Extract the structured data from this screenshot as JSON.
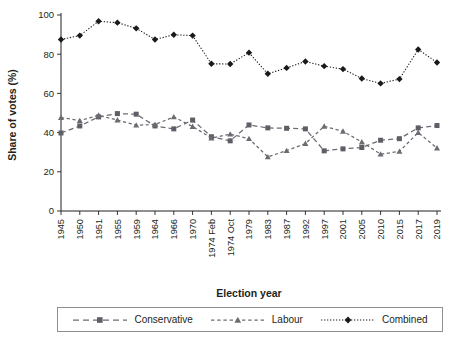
{
  "chart_data": {
    "type": "line",
    "title": "",
    "xlabel": "Election year",
    "ylabel": "Share of votes (%)",
    "ylim": [
      0,
      100
    ],
    "yticks": [
      0,
      20,
      40,
      60,
      80,
      100
    ],
    "grid": false,
    "legend_position": "bottom",
    "categories": [
      "1945",
      "1950",
      "1951",
      "1955",
      "1959",
      "1964",
      "1966",
      "1970",
      "1974 Feb",
      "1974 Oct",
      "1979",
      "1983",
      "1987",
      "1992",
      "1997",
      "2001",
      "2005",
      "2010",
      "2015",
      "2017",
      "2019"
    ],
    "series": [
      {
        "name": "Conservative",
        "marker": "square",
        "linestyle": "dashed",
        "color": "#5e5e66",
        "values": [
          39.8,
          43.4,
          48.0,
          49.7,
          49.4,
          43.4,
          41.9,
          46.4,
          37.9,
          35.8,
          43.9,
          42.4,
          42.2,
          41.9,
          30.7,
          31.7,
          32.4,
          36.1,
          36.9,
          42.4,
          43.6
        ]
      },
      {
        "name": "Labour",
        "marker": "triangle",
        "linestyle": "dashed",
        "color": "#6b6b72",
        "values": [
          47.7,
          46.1,
          48.8,
          46.4,
          43.8,
          44.1,
          48.0,
          43.1,
          37.2,
          39.2,
          36.9,
          27.6,
          30.8,
          34.4,
          43.2,
          40.7,
          35.2,
          29.0,
          30.4,
          40.0,
          32.1
        ]
      },
      {
        "name": "Combined",
        "marker": "diamond",
        "linestyle": "dotted",
        "color": "#1a1a1a",
        "values": [
          87.5,
          89.5,
          96.8,
          96.1,
          93.2,
          87.5,
          89.9,
          89.5,
          75.1,
          75.0,
          80.8,
          70.0,
          73.0,
          76.3,
          73.9,
          72.4,
          67.6,
          65.1,
          67.3,
          82.4,
          75.8
        ]
      }
    ]
  },
  "legend": {
    "items": [
      {
        "label": "Conservative",
        "style": "dashed-square"
      },
      {
        "label": "Labour",
        "style": "dashed-triangle"
      },
      {
        "label": "Combined",
        "style": "dotted-diamond"
      }
    ]
  }
}
